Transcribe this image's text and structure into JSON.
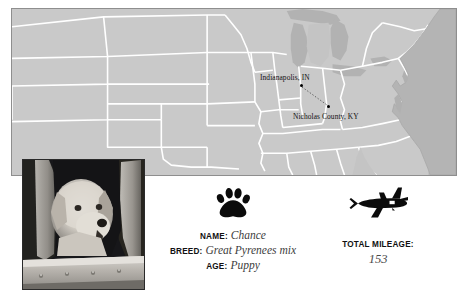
{
  "map": {
    "background_color": "#c9c9c9",
    "border_color": "#8e8e8e",
    "state_border_color": "#ffffff",
    "water_color": "#b4b4b4",
    "cities": [
      {
        "label": "Indianapolis, IN",
        "marker": "city-dot"
      },
      {
        "label": "Nicholas County, KY",
        "marker": "city-dot"
      }
    ],
    "route": {
      "style": "dotted",
      "color": "#555555"
    }
  },
  "photo": {
    "alt": "puppy looking out of an airplane window",
    "subject": "white puppy",
    "setting": "aircraft window"
  },
  "icons": {
    "paw": "paw-print-icon",
    "plane": "airplane-icon"
  },
  "dog": {
    "name_label": "NAME:",
    "name_value": "Chance",
    "breed_label": "BREED:",
    "breed_value": "Great Pyrenees mix",
    "age_label": "AGE:",
    "age_value": "Puppy"
  },
  "mileage": {
    "label": "TOTAL MILEAGE:",
    "value": "153"
  },
  "colors": {
    "text": "#111111",
    "value_text": "#3d3d3d",
    "icon": "#000000"
  }
}
